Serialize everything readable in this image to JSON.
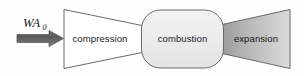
{
  "diagram": {
    "background_color": "#fefefe",
    "outline_color": "#6b6b6b",
    "text_color": "#1a1a1a",
    "flow_inlet": {
      "symbol": "WA",
      "subscript": "0",
      "arrow_name": "inlet-air-mass-flow-arrow",
      "arrow_color_dark": "#58585a",
      "arrow_color_light": "#7d7d80"
    },
    "stages": [
      {
        "id": "compression",
        "label": "compression",
        "shape": "trapezoid-converging",
        "fill": "#ffffff"
      },
      {
        "id": "combustion",
        "label": "combustion",
        "shape": "rounded-rectangle",
        "fill": "#eeeeee"
      },
      {
        "id": "expansion",
        "label": "expansion",
        "shape": "trapezoid-diverging",
        "fill_start": "#9c9c9c",
        "fill_end": "#d8d8d8"
      }
    ]
  }
}
